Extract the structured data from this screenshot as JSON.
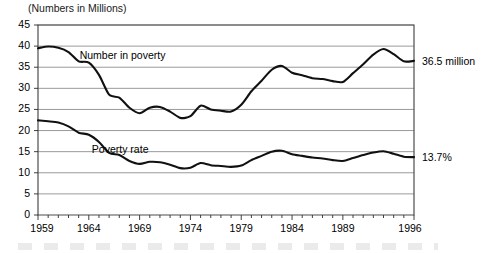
{
  "chart_data": {
    "type": "line",
    "title": "(Numbers in Millions)",
    "xlabel": "",
    "ylabel": "",
    "grid": true,
    "legend_position": "inline-annotations",
    "xlim": [
      1959,
      1996
    ],
    "ylim": [
      0,
      45
    ],
    "ytick_values": [
      0,
      5,
      10,
      15,
      20,
      25,
      30,
      35,
      40,
      45
    ],
    "ytick_labels": [
      "0",
      "5",
      "10",
      "15",
      "20",
      "25",
      "30",
      "35",
      "40",
      "45"
    ],
    "xtick_labels": [
      "1959",
      "1964",
      "1969",
      "1974",
      "1979",
      "1984",
      "1989",
      "1996"
    ],
    "xtick_values": [
      1959,
      1964,
      1969,
      1974,
      1979,
      1984,
      1989,
      1996
    ],
    "minor_xticks_every": 1,
    "x": [
      1959,
      1960,
      1961,
      1962,
      1963,
      1964,
      1965,
      1966,
      1967,
      1968,
      1969,
      1970,
      1971,
      1972,
      1973,
      1974,
      1975,
      1976,
      1977,
      1978,
      1979,
      1980,
      1981,
      1982,
      1983,
      1984,
      1985,
      1986,
      1987,
      1988,
      1989,
      1990,
      1991,
      1992,
      1993,
      1994,
      1995,
      1996
    ],
    "series": [
      {
        "name": "Number in poverty",
        "label": "Number in poverty",
        "units": "millions",
        "color": "#111111",
        "end_annotation": "36.5 million",
        "end_value": 36.5,
        "values": [
          39.5,
          39.9,
          39.6,
          38.6,
          36.4,
          36.1,
          33.2,
          28.5,
          27.8,
          25.4,
          24.1,
          25.4,
          25.6,
          24.5,
          23.0,
          23.4,
          25.9,
          25.0,
          24.7,
          24.5,
          26.1,
          29.3,
          31.8,
          34.4,
          35.3,
          33.7,
          33.1,
          32.4,
          32.2,
          31.7,
          31.5,
          33.6,
          35.7,
          38.0,
          39.3,
          38.1,
          36.4,
          36.5
        ]
      },
      {
        "name": "Poverty rate",
        "label": "Poverty rate",
        "units": "percent",
        "color": "#111111",
        "end_annotation": "13.7%",
        "end_value": 13.7,
        "values": [
          22.4,
          22.2,
          21.9,
          21.0,
          19.5,
          19.0,
          17.3,
          14.7,
          14.2,
          12.8,
          12.1,
          12.6,
          12.5,
          11.9,
          11.1,
          11.2,
          12.3,
          11.8,
          11.6,
          11.4,
          11.7,
          13.0,
          14.0,
          15.0,
          15.2,
          14.4,
          14.0,
          13.6,
          13.4,
          13.0,
          12.8,
          13.5,
          14.2,
          14.8,
          15.1,
          14.5,
          13.8,
          13.7
        ]
      }
    ]
  },
  "annotations": {
    "number_in_poverty_label": "Number in poverty",
    "poverty_rate_label": "Poverty rate",
    "number_end": "36.5 million",
    "rate_end": "13.7%"
  }
}
